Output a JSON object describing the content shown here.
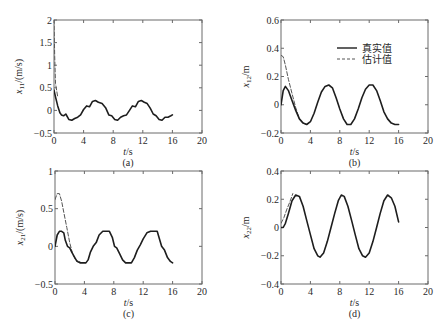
{
  "chart_data": [
    {
      "id": "a",
      "type": "line",
      "caption": "(a)",
      "xlabel": "t/s",
      "ylabel": "x11/(m/s)",
      "ylabel_main": "x",
      "ylabel_sub": "11",
      "ylabel_unit": "/(m/s)",
      "xlim": [
        0,
        20
      ],
      "ylim": [
        -0.5,
        2
      ],
      "xticks": [
        0,
        4,
        8,
        12,
        16,
        20
      ],
      "yticks": [
        -0.5,
        0,
        0.5,
        1,
        1.5,
        2
      ],
      "ytick_labels": [
        "-0.5",
        "0",
        "0.5",
        "1",
        "1.5",
        "2"
      ],
      "grid": false,
      "legend": null,
      "series": [
        {
          "name": "真实值",
          "style": "solid",
          "x": [
            0,
            0.2,
            0.5,
            0.8,
            1.0,
            1.3,
            1.6,
            2.0,
            2.4,
            2.8,
            3.2,
            3.6,
            4.0,
            4.4,
            4.8,
            5.2,
            5.6,
            6.0,
            6.5,
            7.0,
            7.4,
            7.8,
            8.2,
            8.6,
            9.0,
            9.4,
            9.8,
            10.2,
            10.6,
            11.0,
            11.4,
            11.8,
            12.2,
            12.6,
            13.0,
            13.4,
            13.8,
            14.2,
            14.6,
            15.0,
            15.4,
            15.8,
            16.0
          ],
          "y": [
            0.45,
            0.3,
            0.1,
            -0.05,
            -0.1,
            -0.12,
            -0.08,
            -0.2,
            -0.22,
            -0.18,
            -0.15,
            -0.1,
            0.02,
            0.1,
            0.08,
            0.2,
            0.22,
            0.18,
            0.15,
            0.05,
            -0.1,
            -0.12,
            -0.2,
            -0.22,
            -0.15,
            -0.12,
            -0.1,
            0.0,
            0.1,
            0.08,
            0.2,
            0.22,
            0.18,
            0.15,
            0.05,
            -0.08,
            -0.12,
            -0.2,
            -0.22,
            -0.15,
            -0.15,
            -0.12,
            -0.1
          ]
        },
        {
          "name": "估计值",
          "style": "dashed",
          "x": [
            0,
            0.1,
            0.2,
            0.35,
            0.5
          ],
          "y": [
            2.0,
            1.2,
            0.6,
            0.45,
            0.3
          ]
        }
      ]
    },
    {
      "id": "b",
      "type": "line",
      "caption": "(b)",
      "xlabel": "t/s",
      "ylabel": "x12/m",
      "ylabel_main": "x",
      "ylabel_sub": "12",
      "ylabel_unit": "/m",
      "xlim": [
        0,
        20
      ],
      "ylim": [
        -0.2,
        0.6
      ],
      "xticks": [
        0,
        4,
        8,
        12,
        16,
        20
      ],
      "yticks": [
        -0.2,
        0,
        0.2,
        0.4,
        0.6
      ],
      "ytick_labels": [
        "-0.2",
        "0",
        "0.2",
        "0.4",
        "0.6"
      ],
      "grid": false,
      "legend": {
        "position": "upper right",
        "entries": [
          {
            "label": "真实值",
            "style": "solid"
          },
          {
            "label": "估计值",
            "style": "dashed"
          }
        ]
      },
      "series": [
        {
          "name": "真实值",
          "style": "solid",
          "x": [
            0,
            0.3,
            0.6,
            1.0,
            1.5,
            2.0,
            2.5,
            3.0,
            3.5,
            4.0,
            4.5,
            5.0,
            5.5,
            6.0,
            6.5,
            7.0,
            7.5,
            8.0,
            8.5,
            9.0,
            9.5,
            10.0,
            10.5,
            11.0,
            11.5,
            12.0,
            12.5,
            13.0,
            13.5,
            14.0,
            14.5,
            15.0,
            15.5,
            16.0
          ],
          "y": [
            0.0,
            0.1,
            0.13,
            0.1,
            0.03,
            -0.04,
            -0.1,
            -0.13,
            -0.14,
            -0.12,
            -0.06,
            0.02,
            0.09,
            0.13,
            0.14,
            0.12,
            0.05,
            -0.03,
            -0.1,
            -0.14,
            -0.14,
            -0.1,
            -0.03,
            0.05,
            0.11,
            0.14,
            0.14,
            0.1,
            0.03,
            -0.05,
            -0.1,
            -0.13,
            -0.14,
            -0.14
          ]
        },
        {
          "name": "估计值",
          "style": "dashed",
          "x": [
            0,
            0.3,
            0.6,
            1.0,
            1.5,
            2.0,
            2.5,
            3.0,
            3.5
          ],
          "y": [
            0.35,
            0.34,
            0.28,
            0.18,
            0.08,
            -0.02,
            -0.1,
            -0.13,
            -0.14
          ]
        }
      ]
    },
    {
      "id": "c",
      "type": "line",
      "caption": "(c)",
      "xlabel": "t/s",
      "ylabel": "x21/(m/s)",
      "ylabel_main": "x",
      "ylabel_sub": "21",
      "ylabel_unit": "/(m/s)",
      "xlim": [
        0,
        20
      ],
      "ylim": [
        -0.5,
        1
      ],
      "xticks": [
        0,
        4,
        8,
        12,
        16,
        20
      ],
      "yticks": [
        -0.5,
        0,
        0.5,
        1
      ],
      "ytick_labels": [
        "-0.5",
        "0",
        "0.5",
        "1"
      ],
      "grid": false,
      "legend": null,
      "series": [
        {
          "name": "真实值",
          "style": "solid",
          "x": [
            0,
            0.3,
            0.6,
            0.9,
            1.2,
            1.4,
            1.7,
            2.0,
            2.3,
            2.7,
            3.0,
            3.4,
            3.8,
            4.2,
            4.5,
            4.8,
            5.2,
            5.6,
            6.0,
            6.5,
            7.0,
            7.4,
            7.8,
            8.1,
            8.4,
            8.8,
            9.2,
            9.6,
            10.0,
            10.4,
            10.8,
            11.2,
            11.6,
            12.0,
            12.5,
            13.0,
            13.5,
            13.9,
            14.2,
            14.5,
            14.9,
            15.3,
            15.7,
            16.0
          ],
          "y": [
            0.0,
            0.15,
            0.2,
            0.2,
            0.18,
            0.08,
            0.0,
            -0.02,
            -0.08,
            -0.15,
            -0.2,
            -0.22,
            -0.22,
            -0.22,
            -0.18,
            -0.08,
            0.0,
            0.05,
            0.15,
            0.2,
            0.2,
            0.2,
            0.12,
            0.0,
            -0.02,
            -0.1,
            -0.18,
            -0.22,
            -0.22,
            -0.22,
            -0.15,
            -0.05,
            0.02,
            0.1,
            0.18,
            0.2,
            0.2,
            0.2,
            0.1,
            0.0,
            -0.05,
            -0.15,
            -0.2,
            -0.22
          ]
        },
        {
          "name": "估计值",
          "style": "dashed",
          "x": [
            0,
            0.3,
            0.6,
            0.9,
            1.2,
            1.6,
            2.0,
            2.4,
            2.8,
            3.2,
            3.6
          ],
          "y": [
            0.62,
            0.7,
            0.7,
            0.6,
            0.45,
            0.25,
            0.05,
            -0.1,
            -0.18,
            -0.2,
            -0.21
          ]
        }
      ]
    },
    {
      "id": "d",
      "type": "line",
      "caption": "(d)",
      "xlabel": "t/s",
      "ylabel": "x22/m",
      "ylabel_main": "x",
      "ylabel_sub": "22",
      "ylabel_unit": "/m",
      "xlim": [
        0,
        20
      ],
      "ylim": [
        -0.4,
        0.4
      ],
      "xticks": [
        0,
        4,
        8,
        12,
        16,
        20
      ],
      "yticks": [
        -0.4,
        -0.2,
        0,
        0.2,
        0.4
      ],
      "ytick_labels": [
        "-0.4",
        "-0.2",
        "0",
        "0.2",
        "0.4"
      ],
      "grid": false,
      "legend": null,
      "series": [
        {
          "name": "真实值",
          "style": "solid",
          "x": [
            0,
            0.3,
            0.6,
            1.0,
            1.5,
            2.0,
            2.5,
            3.0,
            3.5,
            4.0,
            4.5,
            5.0,
            5.3,
            5.8,
            6.3,
            6.8,
            7.3,
            7.8,
            8.2,
            8.6,
            9.1,
            9.6,
            10.1,
            10.6,
            11.1,
            11.5,
            12.0,
            12.5,
            13.0,
            13.5,
            14.0,
            14.5,
            15.0,
            15.5,
            16.0
          ],
          "y": [
            0.0,
            0.0,
            0.03,
            0.1,
            0.19,
            0.23,
            0.22,
            0.15,
            0.05,
            -0.05,
            -0.15,
            -0.2,
            -0.21,
            -0.18,
            -0.1,
            0.0,
            0.1,
            0.19,
            0.23,
            0.22,
            0.15,
            0.05,
            -0.05,
            -0.15,
            -0.2,
            -0.21,
            -0.18,
            -0.1,
            0.0,
            0.1,
            0.19,
            0.23,
            0.21,
            0.15,
            0.04
          ]
        },
        {
          "name": "估计值",
          "style": "dashed",
          "x": [
            0,
            0.4,
            0.8,
            1.2,
            1.6
          ],
          "y": [
            0.03,
            0.07,
            0.13,
            0.18,
            0.24
          ]
        }
      ]
    }
  ],
  "layout": {
    "panels": [
      {
        "id": "a",
        "left": 54,
        "right": 202,
        "top": 20,
        "bottom": 133
      },
      {
        "id": "b",
        "left": 281,
        "right": 428,
        "top": 20,
        "bottom": 133
      },
      {
        "id": "c",
        "left": 55,
        "right": 202,
        "top": 171,
        "bottom": 284
      },
      {
        "id": "d",
        "left": 281,
        "right": 428,
        "top": 171,
        "bottom": 284
      }
    ],
    "line_color": "#1e1e1e",
    "dash_color": "#555555",
    "axis_color": "#6a6a6a"
  }
}
